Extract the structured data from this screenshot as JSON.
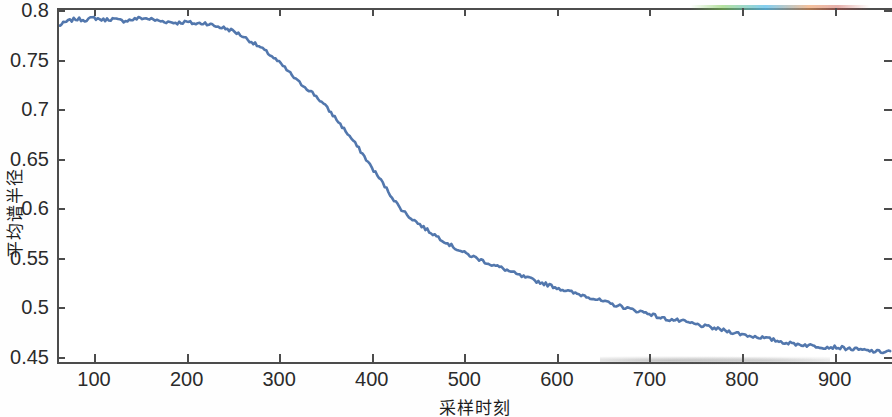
{
  "figure": {
    "x_axis_title": "采样时刻",
    "y_axis_title": "平均谱半径",
    "line_color": "#5277ad"
  },
  "chart_data": {
    "type": "line",
    "title": "",
    "subtitle": "",
    "xlabel": "采样时刻",
    "ylabel": "平均谱半径",
    "xlim": [
      60,
      962
    ],
    "ylim": [
      0.445,
      0.802
    ],
    "xticks": [
      100,
      200,
      300,
      400,
      500,
      600,
      700,
      800,
      900
    ],
    "xticklabels": [
      "100",
      "200",
      "300",
      "400",
      "500",
      "600",
      "700",
      "800",
      "900"
    ],
    "yticks": [
      0.45,
      0.5,
      0.55,
      0.6,
      0.65,
      0.7,
      0.75,
      0.8
    ],
    "yticklabels": [
      "0.45",
      "0.5",
      "0.55",
      "0.6",
      "0.65",
      "0.7",
      "0.75",
      "0.8"
    ],
    "grid": false,
    "legend": null,
    "legend_position": "none",
    "series": [
      {
        "name": "平均谱半径",
        "color": "#5277ad",
        "line_width": 2.6,
        "x": [
          62,
          70,
          80,
          90,
          100,
          110,
          120,
          130,
          140,
          150,
          160,
          170,
          180,
          190,
          200,
          210,
          220,
          230,
          240,
          250,
          260,
          270,
          280,
          290,
          300,
          310,
          320,
          330,
          340,
          350,
          360,
          370,
          380,
          390,
          400,
          410,
          420,
          430,
          440,
          450,
          460,
          470,
          480,
          490,
          500,
          510,
          520,
          530,
          540,
          550,
          560,
          570,
          580,
          590,
          600,
          610,
          620,
          630,
          640,
          650,
          660,
          670,
          680,
          690,
          700,
          710,
          720,
          730,
          740,
          750,
          760,
          770,
          780,
          790,
          800,
          810,
          820,
          830,
          840,
          850,
          860,
          870,
          880,
          890,
          900,
          910,
          920,
          930,
          940,
          950,
          960
        ],
        "y": [
          0.784,
          0.788,
          0.791,
          0.79,
          0.792,
          0.79,
          0.791,
          0.789,
          0.79,
          0.792,
          0.791,
          0.789,
          0.788,
          0.787,
          0.788,
          0.786,
          0.787,
          0.784,
          0.782,
          0.779,
          0.774,
          0.768,
          0.762,
          0.755,
          0.747,
          0.738,
          0.728,
          0.721,
          0.713,
          0.703,
          0.692,
          0.68,
          0.668,
          0.655,
          0.641,
          0.628,
          0.614,
          0.601,
          0.592,
          0.585,
          0.578,
          0.572,
          0.566,
          0.56,
          0.555,
          0.551,
          0.547,
          0.543,
          0.54,
          0.536,
          0.532,
          0.529,
          0.526,
          0.523,
          0.52,
          0.517,
          0.514,
          0.512,
          0.509,
          0.506,
          0.503,
          0.501,
          0.498,
          0.496,
          0.494,
          0.49,
          0.488,
          0.487,
          0.485,
          0.483,
          0.481,
          0.479,
          0.477,
          0.475,
          0.473,
          0.471,
          0.47,
          0.468,
          0.466,
          0.464,
          0.463,
          0.462,
          0.461,
          0.46,
          0.46,
          0.459,
          0.458,
          0.457,
          0.456,
          0.455,
          0.456
        ]
      }
    ]
  }
}
